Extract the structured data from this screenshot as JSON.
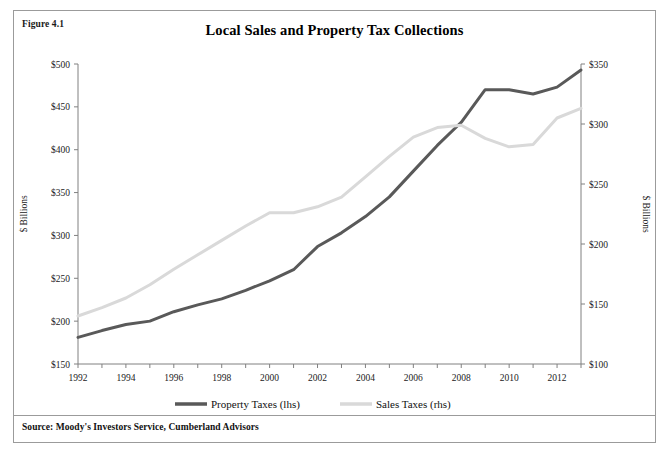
{
  "figure": {
    "number_label": "Figure 4.1",
    "title": "Local Sales and Property Tax Collections",
    "source": "Source: Moody's Investors Service, Cumberland Advisors"
  },
  "colors": {
    "property_taxes": "#595959",
    "sales_taxes": "#d9d9d9",
    "axis": "#808080",
    "text": "#1a1a1a",
    "frame": "#9b9b9b",
    "background": "#ffffff"
  },
  "chart_data": {
    "type": "line",
    "title": "Local Sales and Property Tax Collections",
    "xlabel": "",
    "ylabel": "$ Billions",
    "y2label": "$ Billions",
    "grid": false,
    "legend_position": "bottom",
    "x": [
      1992,
      1993,
      1994,
      1995,
      1996,
      1997,
      1998,
      1999,
      2000,
      2001,
      2002,
      2003,
      2004,
      2005,
      2006,
      2007,
      2008,
      2009,
      2010,
      2011,
      2012,
      2013
    ],
    "xlim": [
      1992,
      2013
    ],
    "xticks": [
      1992,
      1994,
      1996,
      1998,
      2000,
      2002,
      2004,
      2006,
      2008,
      2010,
      2012
    ],
    "xtick_labels": [
      "1992",
      "1994",
      "1996",
      "1998",
      "2000",
      "2002",
      "2004",
      "2006",
      "2008",
      "2010",
      "2012"
    ],
    "ylim": [
      150,
      500
    ],
    "yticks": [
      150,
      200,
      250,
      300,
      350,
      400,
      450,
      500
    ],
    "ytick_labels": [
      "$150",
      "$200",
      "$250",
      "$300",
      "$350",
      "$400",
      "$450",
      "$500"
    ],
    "y2lim": [
      100,
      350
    ],
    "y2ticks": [
      100,
      150,
      200,
      250,
      300,
      350
    ],
    "y2tick_labels": [
      "$100",
      "$150",
      "$200",
      "$250",
      "$300",
      "$350"
    ],
    "series": [
      {
        "name": "Property Taxes (lhs)",
        "axis": "left",
        "color": "#595959",
        "values": [
          181,
          189,
          196,
          200,
          211,
          219,
          226,
          236,
          247,
          260,
          287,
          303,
          322,
          345,
          375,
          405,
          432,
          470,
          470,
          465,
          473,
          493
        ]
      },
      {
        "name": "Sales Taxes (rhs)",
        "axis": "right",
        "color": "#d9d9d9",
        "values": [
          140,
          147,
          155,
          166,
          179,
          191,
          203,
          215,
          226,
          226,
          231,
          239,
          256,
          273,
          289,
          297,
          299,
          288,
          281,
          283,
          305,
          313
        ]
      }
    ]
  },
  "legend": {
    "items": [
      {
        "label": "Property Taxes (lhs)",
        "color": "#595959"
      },
      {
        "label": "Sales Taxes (rhs)",
        "color": "#d9d9d9"
      }
    ]
  }
}
